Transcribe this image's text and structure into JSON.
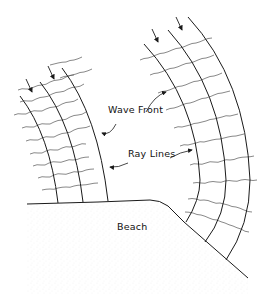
{
  "figure": {
    "type": "wave refraction diagram",
    "labels": {
      "wave_front": "Wave Front",
      "ray_lines": "Ray Lines",
      "beach": "Beach"
    },
    "groups": [
      {
        "name": "left-ray-group",
        "ray_count": 3,
        "arrow_count": 2,
        "shore": "straight beach"
      },
      {
        "name": "right-ray-group",
        "ray_count": 3,
        "arrow_count": 2,
        "shore": "sloped headland"
      }
    ],
    "colors": {
      "line": "#1a1a1a",
      "wavefront": "#555555",
      "sand": "#9a9a9a",
      "background": "#ffffff"
    }
  }
}
